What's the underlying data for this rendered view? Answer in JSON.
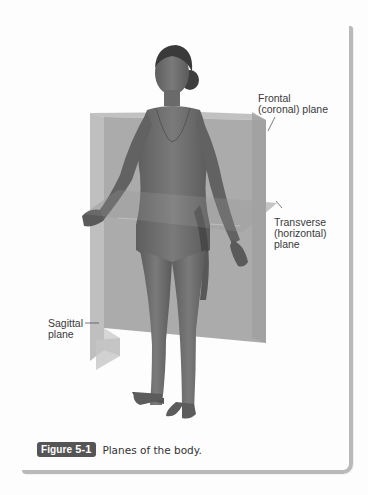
{
  "figure": {
    "badge_word": "Figure",
    "badge_number": "5-1",
    "caption": "Planes of the body."
  },
  "labels": {
    "frontal": "Frontal\n(coronal) plane",
    "transverse": "Transverse\n(horizontal)\nplane",
    "sagittal": "Sagittal\nplane"
  },
  "illustration": {
    "subject": "standing female anatomical figure",
    "planes": [
      "frontal (coronal)",
      "transverse (horizontal)",
      "sagittal"
    ]
  },
  "colors": {
    "plane_fill": "#9a9a9a",
    "figure_skin": "#6e6e6e",
    "badge_bg": "#555555",
    "frame_border": "#b9b9b9",
    "label_text": "#3a3a3a"
  }
}
